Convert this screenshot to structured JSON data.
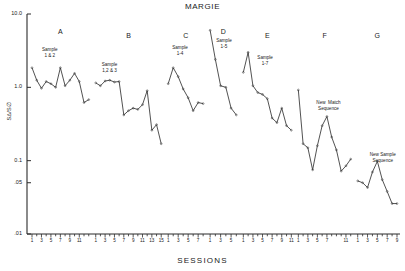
{
  "chart_data": {
    "type": "line",
    "title": "MARGIE",
    "xlabel": "SESSIONS",
    "ylabel": "S∆/S∅",
    "yscale": "log",
    "ylim": [
      0.01,
      10.0
    ],
    "ytick_labels": [
      "10.0",
      "1.0",
      "0.1",
      ".05",
      ".01"
    ],
    "ytick_values": [
      10.0,
      1.0,
      0.1,
      0.05,
      0.01
    ],
    "grid": false,
    "legend": "none",
    "panels": [
      {
        "label": "A",
        "annotation": "Sample\n1 & 2",
        "x": [
          1,
          2,
          3,
          4,
          5,
          6,
          7,
          8,
          9,
          10,
          11,
          12,
          13
        ],
        "values": [
          1.85,
          1.25,
          0.97,
          1.2,
          1.12,
          1.0,
          1.85,
          1.05,
          1.25,
          1.55,
          1.2,
          0.62,
          0.68
        ],
        "xticks": [
          1,
          3,
          5,
          7,
          9,
          11
        ]
      },
      {
        "label": "B",
        "annotation": "Sample\n1,2 & 3",
        "x": [
          1,
          2,
          3,
          4,
          5,
          6,
          7,
          8,
          9,
          10,
          11,
          12,
          13,
          14,
          15
        ],
        "values": [
          1.15,
          1.05,
          1.22,
          1.25,
          1.18,
          1.2,
          0.42,
          0.48,
          0.52,
          0.5,
          0.58,
          0.9,
          0.26,
          0.31,
          0.17
        ],
        "xticks": [
          1,
          3,
          5,
          7,
          9,
          11,
          13,
          15
        ]
      },
      {
        "label": "C",
        "annotation": "Sample\n1-4",
        "x": [
          1,
          2,
          3,
          4,
          5,
          6,
          7,
          8
        ],
        "values": [
          1.12,
          1.85,
          1.4,
          0.95,
          0.72,
          0.48,
          0.62,
          0.6
        ],
        "xticks": [
          1,
          3,
          5,
          7
        ]
      },
      {
        "label": "D",
        "annotation": "Sample\n1-5",
        "x": [
          1,
          2,
          3,
          4,
          5,
          6
        ],
        "values": [
          6.0,
          2.4,
          1.05,
          1.0,
          0.52,
          0.42
        ],
        "xticks": [
          1,
          3,
          5
        ]
      },
      {
        "label": "E",
        "annotation": "Sample\n1-7",
        "x": [
          1,
          2,
          3,
          4,
          5,
          6,
          7,
          8,
          9,
          10,
          11
        ],
        "values": [
          1.6,
          3.0,
          1.05,
          0.85,
          0.8,
          0.7,
          0.38,
          0.33,
          0.52,
          0.3,
          0.26
        ],
        "xticks": [
          1,
          3,
          5,
          7,
          9,
          11
        ]
      },
      {
        "label": "F",
        "annotation": "New  Match\nSequence",
        "x": [
          1,
          2,
          3,
          4,
          5,
          6,
          7,
          8,
          9,
          10,
          11,
          12
        ],
        "values": [
          0.92,
          0.17,
          0.15,
          0.075,
          0.16,
          0.3,
          0.4,
          0.21,
          0.14,
          0.072,
          0.085,
          0.105
        ],
        "xticks": [
          1,
          3,
          5,
          7,
          11
        ]
      },
      {
        "label": "G",
        "annotation": "New Sample\nSequence",
        "x": [
          1,
          2,
          3,
          4,
          5,
          6,
          7,
          8,
          9
        ],
        "values": [
          0.053,
          0.05,
          0.043,
          0.07,
          0.098,
          0.055,
          0.038,
          0.026,
          0.026
        ],
        "xticks": [
          1,
          3,
          5,
          7,
          9
        ]
      }
    ]
  }
}
